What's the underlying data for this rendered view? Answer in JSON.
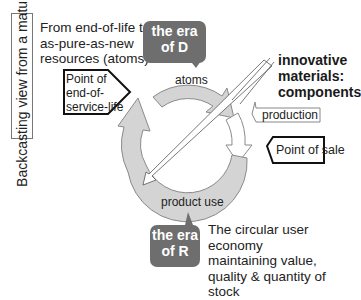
{
  "side_label": "Backcasting view from a mature CE",
  "top_left_text": [
    "From end-of-life to",
    "as-pure-as-new",
    "resources (atoms)"
  ],
  "era_d": [
    "the era",
    "of D"
  ],
  "era_r": [
    "the era",
    "of R"
  ],
  "point_end_of_service": [
    "Point of",
    "end-of-",
    "service-life"
  ],
  "innovative": [
    "innovative",
    "materials:",
    "components"
  ],
  "production": "production",
  "point_of_sale": "Point of sale",
  "atoms": "atoms",
  "product_use": "product use",
  "bottom_text": [
    "The circular user economy",
    "maintaining value,",
    "quality & quantity of stock"
  ],
  "colors": {
    "era_fill": "#6e6e6e",
    "ring_fill": "#d4d4d4",
    "ring_stroke": "#8a8a8a"
  }
}
